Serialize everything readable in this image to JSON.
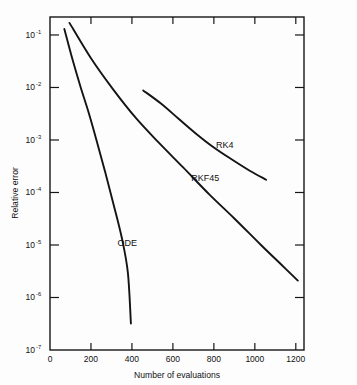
{
  "chart_data": {
    "type": "line",
    "title": "",
    "xlabel": "Number of evaluations",
    "ylabel": "Relative error",
    "xlim": [
      0,
      1240
    ],
    "ylim": [
      1e-07,
      0.22
    ],
    "yscale": "log",
    "xscale": "linear",
    "grid": false,
    "legend": "inline-labels",
    "xticks": [
      0,
      200,
      400,
      600,
      800,
      1000,
      1200
    ],
    "xtick_labels": [
      "0",
      "200",
      "400",
      "600",
      "800",
      "1000",
      "1200"
    ],
    "yticks": [
      0.1,
      0.01,
      0.001,
      0.0001,
      1e-05,
      1e-06,
      1e-07
    ],
    "ytick_labels": [
      "10-1",
      "10-2",
      "10-3",
      "10-4",
      "10-5",
      "10-6",
      "10-7"
    ],
    "ytick_mantissa": "10",
    "ytick_exponents": [
      "-1",
      "-2",
      "-3",
      "-4",
      "-5",
      "-6",
      "-7"
    ],
    "series": [
      {
        "name": "ODE",
        "label": "ODE",
        "label_x": 330,
        "label_y": 1.1e-05,
        "points": [
          {
            "x": 70,
            "y": 0.13
          },
          {
            "x": 110,
            "y": 0.034
          },
          {
            "x": 150,
            "y": 0.01
          },
          {
            "x": 190,
            "y": 0.0032
          },
          {
            "x": 230,
            "y": 0.0009
          },
          {
            "x": 270,
            "y": 0.00024
          },
          {
            "x": 310,
            "y": 6e-05
          },
          {
            "x": 350,
            "y": 1.4e-05
          },
          {
            "x": 380,
            "y": 3e-06
          },
          {
            "x": 395,
            "y": 3.2e-07
          }
        ]
      },
      {
        "name": "RKF45",
        "label": "RKF45",
        "label_x": 690,
        "label_y": 0.00019,
        "points": [
          {
            "x": 95,
            "y": 0.17
          },
          {
            "x": 200,
            "y": 0.036
          },
          {
            "x": 310,
            "y": 0.009
          },
          {
            "x": 420,
            "y": 0.0026
          },
          {
            "x": 530,
            "y": 0.0009
          },
          {
            "x": 650,
            "y": 0.0003
          },
          {
            "x": 780,
            "y": 9e-05
          },
          {
            "x": 900,
            "y": 3.2e-05
          },
          {
            "x": 1030,
            "y": 1e-05
          },
          {
            "x": 1130,
            "y": 4.2e-06
          },
          {
            "x": 1210,
            "y": 2.1e-06
          }
        ]
      },
      {
        "name": "RK4",
        "label": "RK4",
        "label_x": 810,
        "label_y": 0.0008,
        "points": [
          {
            "x": 455,
            "y": 0.0088
          },
          {
            "x": 540,
            "y": 0.005
          },
          {
            "x": 625,
            "y": 0.0026
          },
          {
            "x": 710,
            "y": 0.00135
          },
          {
            "x": 800,
            "y": 0.00072
          },
          {
            "x": 890,
            "y": 0.00042
          },
          {
            "x": 975,
            "y": 0.00026
          },
          {
            "x": 1055,
            "y": 0.000175
          }
        ]
      }
    ]
  },
  "colors": {
    "curve": "#141414",
    "axis": "#161616",
    "background": "#fdfdfd",
    "text": "#111111"
  }
}
